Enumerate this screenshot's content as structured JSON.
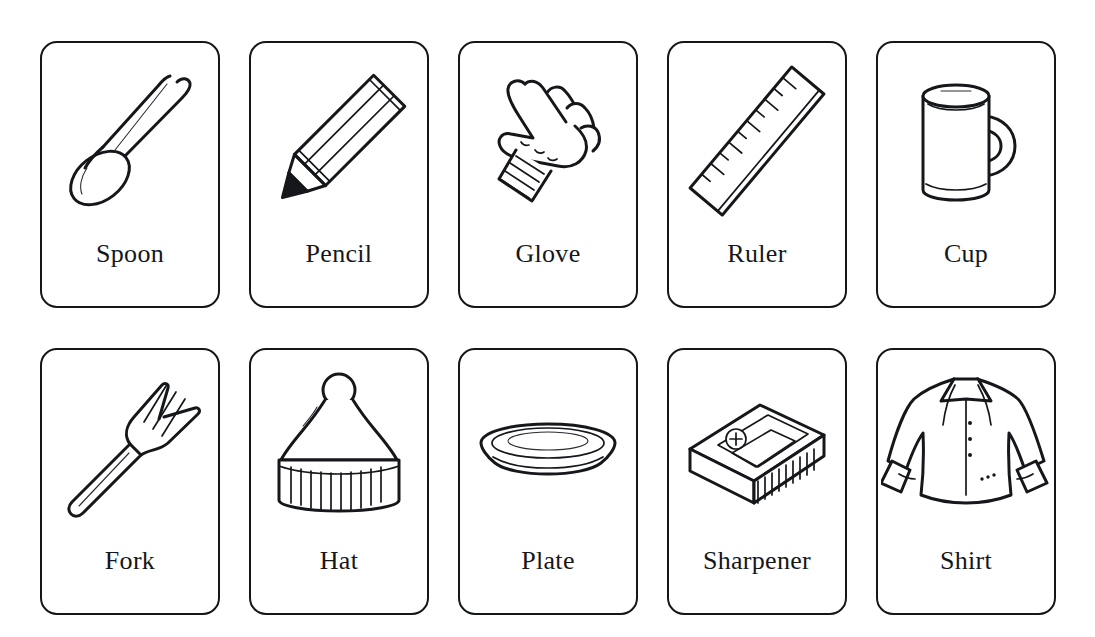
{
  "page": {
    "background_color": "#ffffff",
    "ink_color": "#15171b",
    "layout": "grid",
    "columns": 5,
    "rows": 2
  },
  "cards": [
    {
      "label": "Spoon",
      "icon": "spoon-icon"
    },
    {
      "label": "Pencil",
      "icon": "pencil-icon"
    },
    {
      "label": "Glove",
      "icon": "glove-icon"
    },
    {
      "label": "Ruler",
      "icon": "ruler-icon"
    },
    {
      "label": "Cup",
      "icon": "cup-icon"
    },
    {
      "label": "Fork",
      "icon": "fork-icon"
    },
    {
      "label": "Hat",
      "icon": "hat-icon"
    },
    {
      "label": "Plate",
      "icon": "plate-icon"
    },
    {
      "label": "Sharpener",
      "icon": "sharpener-icon"
    },
    {
      "label": "Shirt",
      "icon": "shirt-icon"
    }
  ]
}
